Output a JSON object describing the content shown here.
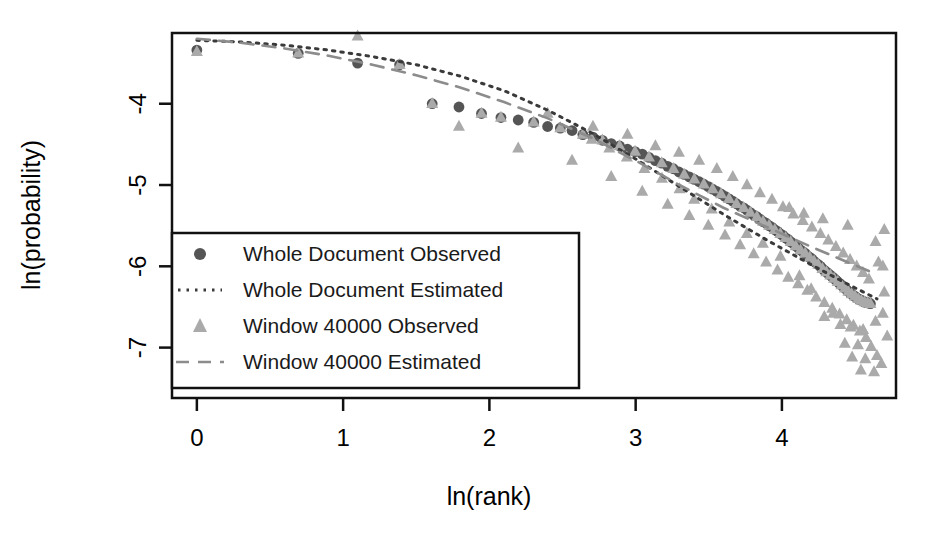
{
  "chart_data": {
    "type": "scatter",
    "title": "",
    "xlabel": "ln(rank)",
    "ylabel": "ln(probability)",
    "xlim": [
      -0.17,
      4.78
    ],
    "ylim": [
      -7.62,
      -3.13
    ],
    "xticks": [
      0,
      1,
      2,
      3,
      4
    ],
    "yticks": [
      -4,
      -5,
      -6,
      -7
    ],
    "xtick_labels": [
      "0",
      "1",
      "2",
      "3",
      "4"
    ],
    "ytick_labels": [
      "-4",
      "-5",
      "-6",
      "-7"
    ],
    "grid": false,
    "legend_position": "bottom-left",
    "colors": {
      "whole_document_observed": "#555555",
      "whole_document_estimated": "#3a3a3a",
      "window_observed": "#aaaaaa",
      "window_estimated": "#8c8c8c",
      "axis": "#111111",
      "background": "#ffffff"
    },
    "series": [
      {
        "name": "Whole Document Observed",
        "marker": "circle",
        "color": "#555555",
        "points": [
          [
            0.0,
            -3.34
          ],
          [
            0.693,
            -3.38
          ],
          [
            1.099,
            -3.5
          ],
          [
            1.386,
            -3.52
          ],
          [
            1.609,
            -4.0
          ],
          [
            1.792,
            -4.04
          ],
          [
            1.946,
            -4.12
          ],
          [
            2.079,
            -4.17
          ],
          [
            2.197,
            -4.2
          ],
          [
            2.303,
            -4.23
          ],
          [
            2.398,
            -4.28
          ],
          [
            2.485,
            -4.3
          ],
          [
            2.565,
            -4.33
          ],
          [
            2.639,
            -4.38
          ],
          [
            2.708,
            -4.41
          ],
          [
            2.773,
            -4.45
          ],
          [
            2.833,
            -4.49
          ],
          [
            2.89,
            -4.52
          ],
          [
            2.944,
            -4.56
          ],
          [
            2.996,
            -4.59
          ],
          [
            3.045,
            -4.62
          ],
          [
            3.091,
            -4.66
          ],
          [
            3.135,
            -4.7
          ],
          [
            3.178,
            -4.73
          ],
          [
            3.219,
            -4.77
          ],
          [
            3.258,
            -4.8
          ],
          [
            3.296,
            -4.84
          ],
          [
            3.332,
            -4.87
          ],
          [
            3.367,
            -4.9
          ],
          [
            3.401,
            -4.93
          ],
          [
            3.434,
            -4.96
          ],
          [
            3.466,
            -4.99
          ],
          [
            3.497,
            -5.02
          ],
          [
            3.526,
            -5.05
          ],
          [
            3.555,
            -5.08
          ],
          [
            3.584,
            -5.11
          ],
          [
            3.611,
            -5.14
          ],
          [
            3.638,
            -5.17
          ],
          [
            3.664,
            -5.2
          ],
          [
            3.689,
            -5.23
          ],
          [
            3.714,
            -5.26
          ],
          [
            3.738,
            -5.28
          ],
          [
            3.761,
            -5.31
          ],
          [
            3.784,
            -5.34
          ],
          [
            3.807,
            -5.37
          ],
          [
            3.829,
            -5.39
          ],
          [
            3.85,
            -5.42
          ],
          [
            3.871,
            -5.45
          ],
          [
            3.892,
            -5.47
          ],
          [
            3.912,
            -5.5
          ],
          [
            3.932,
            -5.52
          ],
          [
            3.951,
            -5.55
          ],
          [
            3.97,
            -5.57
          ],
          [
            3.989,
            -5.6
          ],
          [
            4.007,
            -5.62
          ],
          [
            4.025,
            -5.65
          ],
          [
            4.043,
            -5.67
          ],
          [
            4.06,
            -5.7
          ],
          [
            4.078,
            -5.72
          ],
          [
            4.094,
            -5.75
          ],
          [
            4.111,
            -5.77
          ],
          [
            4.127,
            -5.8
          ],
          [
            4.143,
            -5.82
          ],
          [
            4.159,
            -5.84
          ],
          [
            4.174,
            -5.87
          ],
          [
            4.19,
            -5.89
          ],
          [
            4.205,
            -5.91
          ],
          [
            4.22,
            -5.94
          ],
          [
            4.234,
            -5.96
          ],
          [
            4.248,
            -5.98
          ],
          [
            4.263,
            -6.0
          ],
          [
            4.277,
            -6.03
          ],
          [
            4.29,
            -6.05
          ],
          [
            4.304,
            -6.07
          ],
          [
            4.317,
            -6.09
          ],
          [
            4.331,
            -6.11
          ],
          [
            4.344,
            -6.13
          ],
          [
            4.357,
            -6.15
          ],
          [
            4.369,
            -6.17
          ],
          [
            4.382,
            -6.19
          ],
          [
            4.394,
            -6.21
          ],
          [
            4.407,
            -6.23
          ],
          [
            4.419,
            -6.25
          ],
          [
            4.431,
            -6.27
          ],
          [
            4.443,
            -6.29
          ],
          [
            4.454,
            -6.31
          ],
          [
            4.466,
            -6.32
          ],
          [
            4.477,
            -6.34
          ],
          [
            4.489,
            -6.36
          ],
          [
            4.5,
            -6.37
          ],
          [
            4.511,
            -6.39
          ],
          [
            4.522,
            -6.4
          ],
          [
            4.533,
            -6.41
          ],
          [
            4.543,
            -6.42
          ],
          [
            4.554,
            -6.43
          ],
          [
            4.564,
            -6.44
          ],
          [
            4.575,
            -6.44
          ],
          [
            4.585,
            -6.45
          ],
          [
            4.595,
            -6.45
          ],
          [
            4.605,
            -6.46
          ]
        ]
      },
      {
        "name": "Window 40000 Observed",
        "marker": "triangle",
        "color": "#aaaaaa",
        "points": [
          [
            0.0,
            -3.36
          ],
          [
            0.693,
            -3.38
          ],
          [
            1.099,
            -3.17
          ],
          [
            1.386,
            -3.52
          ],
          [
            1.609,
            -4.0
          ],
          [
            1.792,
            -4.28
          ],
          [
            1.946,
            -4.12
          ],
          [
            2.079,
            -4.17
          ],
          [
            2.197,
            -4.55
          ],
          [
            2.303,
            -4.23
          ],
          [
            2.398,
            -4.12
          ],
          [
            2.485,
            -4.3
          ],
          [
            2.565,
            -4.7
          ],
          [
            2.639,
            -4.38
          ],
          [
            2.708,
            -4.28
          ],
          [
            2.773,
            -4.45
          ],
          [
            2.833,
            -4.9
          ],
          [
            2.89,
            -4.52
          ],
          [
            2.944,
            -4.38
          ],
          [
            2.996,
            -4.59
          ],
          [
            3.045,
            -5.08
          ],
          [
            3.091,
            -4.66
          ],
          [
            3.135,
            -4.52
          ],
          [
            3.178,
            -4.73
          ],
          [
            3.219,
            -5.24
          ],
          [
            3.258,
            -4.8
          ],
          [
            3.296,
            -4.6
          ],
          [
            3.332,
            -4.87
          ],
          [
            3.367,
            -5.38
          ],
          [
            3.401,
            -4.93
          ],
          [
            3.434,
            -4.7
          ],
          [
            3.466,
            -4.99
          ],
          [
            3.497,
            -5.5
          ],
          [
            3.526,
            -5.05
          ],
          [
            3.555,
            -4.8
          ],
          [
            3.584,
            -5.11
          ],
          [
            3.611,
            -5.62
          ],
          [
            3.638,
            -5.17
          ],
          [
            3.664,
            -4.9
          ],
          [
            3.689,
            -5.23
          ],
          [
            3.714,
            -5.74
          ],
          [
            3.738,
            -5.28
          ],
          [
            3.761,
            -5.0
          ],
          [
            3.784,
            -5.34
          ],
          [
            3.807,
            -5.85
          ],
          [
            3.829,
            -5.39
          ],
          [
            3.85,
            -5.1
          ],
          [
            3.871,
            -5.45
          ],
          [
            3.892,
            -5.95
          ],
          [
            3.912,
            -5.5
          ],
          [
            3.932,
            -5.18
          ],
          [
            3.951,
            -5.55
          ],
          [
            3.97,
            -6.05
          ],
          [
            3.989,
            -5.6
          ],
          [
            4.007,
            -5.27
          ],
          [
            4.025,
            -5.65
          ],
          [
            4.043,
            -6.14
          ],
          [
            4.06,
            -5.7
          ],
          [
            4.078,
            -5.36
          ],
          [
            4.094,
            -5.75
          ],
          [
            4.111,
            -6.22
          ],
          [
            4.127,
            -5.8
          ],
          [
            4.143,
            -5.44
          ],
          [
            4.159,
            -5.84
          ],
          [
            4.174,
            -6.3
          ],
          [
            4.19,
            -5.89
          ],
          [
            4.205,
            -5.52
          ],
          [
            4.22,
            -5.94
          ],
          [
            4.234,
            -6.38
          ],
          [
            4.248,
            -5.98
          ],
          [
            4.263,
            -5.6
          ],
          [
            4.277,
            -6.03
          ],
          [
            4.29,
            -6.45
          ],
          [
            4.304,
            -6.07
          ],
          [
            4.317,
            -5.68
          ],
          [
            4.331,
            -6.11
          ],
          [
            4.344,
            -6.52
          ],
          [
            4.357,
            -6.15
          ],
          [
            4.369,
            -5.76
          ],
          [
            4.382,
            -6.19
          ],
          [
            4.394,
            -6.59
          ],
          [
            4.407,
            -6.23
          ],
          [
            4.419,
            -5.84
          ],
          [
            4.431,
            -6.27
          ],
          [
            4.443,
            -6.66
          ],
          [
            4.454,
            -6.31
          ],
          [
            4.466,
            -5.92
          ],
          [
            4.477,
            -6.34
          ],
          [
            4.489,
            -6.73
          ],
          [
            4.5,
            -6.37
          ],
          [
            4.511,
            -6.0
          ],
          [
            4.522,
            -6.4
          ],
          [
            4.533,
            -6.8
          ],
          [
            4.543,
            -6.42
          ],
          [
            4.554,
            -6.08
          ],
          [
            4.564,
            -6.44
          ],
          [
            4.575,
            -6.88
          ],
          [
            4.585,
            -6.45
          ],
          [
            4.595,
            -6.16
          ],
          [
            4.605,
            -6.46
          ],
          [
            4.43,
            -6.95
          ],
          [
            4.52,
            -6.97
          ],
          [
            4.61,
            -6.99
          ],
          [
            4.48,
            -7.12
          ],
          [
            4.57,
            -7.14
          ],
          [
            4.65,
            -7.1
          ],
          [
            4.54,
            -7.28
          ],
          [
            4.63,
            -7.3
          ],
          [
            4.4,
            -6.72
          ],
          [
            4.47,
            -6.75
          ],
          [
            4.555,
            -6.78
          ],
          [
            4.64,
            -6.68
          ],
          [
            4.29,
            -6.62
          ],
          [
            4.35,
            -6.58
          ],
          [
            4.2,
            -6.28
          ],
          [
            4.12,
            -6.12
          ],
          [
            3.99,
            -5.88
          ],
          [
            3.87,
            -5.72
          ],
          [
            3.76,
            -5.6
          ],
          [
            3.64,
            -5.46
          ],
          [
            3.52,
            -5.3
          ],
          [
            3.4,
            -5.18
          ],
          [
            3.3,
            -5.05
          ],
          [
            3.18,
            -4.92
          ],
          [
            3.06,
            -4.8
          ],
          [
            2.94,
            -4.66
          ],
          [
            2.82,
            -4.55
          ],
          [
            2.7,
            -4.44
          ],
          [
            4.7,
            -6.32
          ],
          [
            4.69,
            -6.58
          ],
          [
            4.72,
            -6.86
          ],
          [
            4.68,
            -7.2
          ],
          [
            4.66,
            -5.95
          ],
          [
            4.64,
            -5.7
          ],
          [
            4.7,
            -5.55
          ],
          [
            4.45,
            -5.5
          ],
          [
            4.28,
            -5.42
          ],
          [
            4.15,
            -5.35
          ],
          [
            4.05,
            -5.28
          ],
          [
            4.69,
            -6.0
          ]
        ]
      }
    ],
    "lines": [
      {
        "name": "Whole Document Estimated",
        "style": "dotted",
        "color": "#3a3a3a",
        "points": [
          [
            0.0,
            -3.22
          ],
          [
            0.3,
            -3.24
          ],
          [
            0.6,
            -3.28
          ],
          [
            0.9,
            -3.34
          ],
          [
            1.2,
            -3.42
          ],
          [
            1.5,
            -3.52
          ],
          [
            1.8,
            -3.66
          ],
          [
            2.1,
            -3.84
          ],
          [
            2.4,
            -4.08
          ],
          [
            2.7,
            -4.36
          ],
          [
            3.0,
            -4.68
          ],
          [
            3.3,
            -5.02
          ],
          [
            3.6,
            -5.36
          ],
          [
            3.9,
            -5.68
          ],
          [
            4.2,
            -5.98
          ],
          [
            4.45,
            -6.22
          ],
          [
            4.65,
            -6.4
          ]
        ]
      },
      {
        "name": "Window 40000 Estimated",
        "style": "dashed",
        "color": "#8c8c8c",
        "points": [
          [
            0.0,
            -3.2
          ],
          [
            0.3,
            -3.25
          ],
          [
            0.6,
            -3.32
          ],
          [
            0.9,
            -3.41
          ],
          [
            1.2,
            -3.52
          ],
          [
            1.5,
            -3.65
          ],
          [
            1.8,
            -3.8
          ],
          [
            2.1,
            -3.98
          ],
          [
            2.4,
            -4.18
          ],
          [
            2.7,
            -4.42
          ],
          [
            3.0,
            -4.7
          ],
          [
            3.3,
            -5.0
          ],
          [
            3.6,
            -5.28
          ],
          [
            3.9,
            -5.52
          ],
          [
            4.2,
            -5.76
          ],
          [
            4.45,
            -5.95
          ],
          [
            4.65,
            -6.1
          ]
        ]
      }
    ]
  },
  "legend": {
    "entries": [
      {
        "label": "Whole Document Observed",
        "glyph": "circle-marker"
      },
      {
        "label": "Whole Document Estimated",
        "glyph": "dotted-line"
      },
      {
        "label": "Window 40000 Observed",
        "glyph": "triangle-marker"
      },
      {
        "label": "Window 40000 Estimated",
        "glyph": "dashed-line"
      }
    ]
  }
}
